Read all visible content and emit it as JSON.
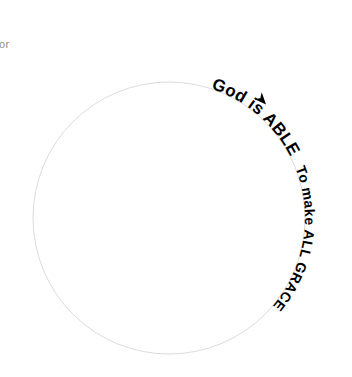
{
  "canvas": {
    "width": 352,
    "height": 377,
    "background_color": "#ffffff"
  },
  "fragment": {
    "text": "or",
    "color": "#8c8c8c"
  },
  "diagram": {
    "circle": {
      "center_x": 169,
      "center_y": 218,
      "radius": 136,
      "stroke_color": "#dcdcdc",
      "stroke_width": 1,
      "fill": "none"
    },
    "labels": [
      {
        "id": "label-god-is-able",
        "text": "God is ABLE",
        "color": "#000000",
        "font_size": 17,
        "start_offset_percent": 5,
        "letter_spacing": 0.4
      },
      {
        "id": "label-to-make-all-grace",
        "text": "To make ALL GRACE",
        "color": "#000000",
        "font_size": 14,
        "start_offset_percent": 19,
        "letter_spacing": 0.4
      }
    ],
    "arrow_marker": {
      "id": "flow-arrow",
      "glyph": "chevron",
      "direction": "clockwise",
      "color": "#000000",
      "x": 262,
      "y": 100,
      "rotation_degrees": 48,
      "size": 13
    }
  }
}
